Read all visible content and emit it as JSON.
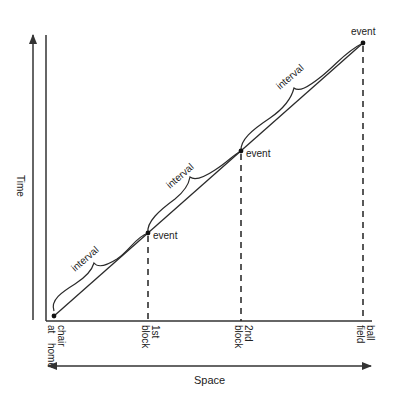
{
  "diagram": {
    "type": "space-time diagram",
    "y_axis_label": "Time",
    "x_axis_label": "Space",
    "locations": [
      {
        "label_line1": "chair",
        "label_line2": "at",
        "label_line3": "home"
      },
      {
        "label_line1": "1st",
        "label_line2": "block"
      },
      {
        "label_line1": "2nd",
        "label_line2": "block"
      },
      {
        "label_line1": "ball",
        "label_line2": "field"
      }
    ],
    "events": [
      {
        "label": "event"
      },
      {
        "label": "event"
      },
      {
        "label": "event"
      }
    ],
    "intervals": [
      {
        "label": "interval"
      },
      {
        "label": "interval"
      },
      {
        "label": "interval"
      }
    ],
    "colors": {
      "line": "#2a2a2a",
      "background": "#ffffff"
    }
  }
}
